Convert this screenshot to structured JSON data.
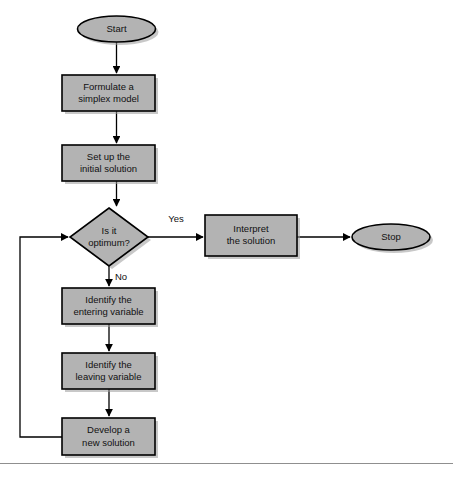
{
  "diagram": {
    "colors": {
      "shape_fill": "#b3b3b3",
      "shape_stroke": "#000000",
      "shadow": "#9a9a9a",
      "connector": "#000000",
      "background": "#ffffff",
      "footer_rule": "#8f8f8f"
    },
    "nodes": [
      {
        "id": "start",
        "shape": "terminator",
        "lines": [
          "Start"
        ],
        "cx": 116.5,
        "cy": 29,
        "rx": 39,
        "ry": 13
      },
      {
        "id": "formulate",
        "shape": "process",
        "lines": [
          "Formulate a",
          "simplex model"
        ],
        "x": 62,
        "y": 75,
        "w": 93,
        "h": 36
      },
      {
        "id": "setup",
        "shape": "process",
        "lines": [
          "Set up the",
          "initial solution"
        ],
        "x": 62,
        "y": 145,
        "w": 93,
        "h": 36
      },
      {
        "id": "decision",
        "shape": "decision",
        "lines": [
          "Is it",
          "optimum?"
        ],
        "cx": 109,
        "cy": 237,
        "hw": 39,
        "hh": 29
      },
      {
        "id": "interpret",
        "shape": "process",
        "lines": [
          "Interpret",
          "the solution"
        ],
        "x": 205,
        "y": 215,
        "w": 92,
        "h": 41
      },
      {
        "id": "stop",
        "shape": "terminator",
        "lines": [
          "Stop"
        ],
        "cx": 391,
        "cy": 237,
        "rx": 39,
        "ry": 13
      },
      {
        "id": "entering",
        "shape": "process",
        "lines": [
          "Identify the",
          "entering variable"
        ],
        "x": 62,
        "y": 288,
        "w": 93,
        "h": 36
      },
      {
        "id": "leaving",
        "shape": "process",
        "lines": [
          "Identify the",
          "leaving variable"
        ],
        "x": 62,
        "y": 353,
        "w": 93,
        "h": 36
      },
      {
        "id": "develop",
        "shape": "process",
        "lines": [
          "Develop a",
          "new solution"
        ],
        "x": 62,
        "y": 418,
        "w": 93,
        "h": 37
      }
    ],
    "edge_labels": [
      {
        "id": "yes-label",
        "text": "Yes",
        "x": 176,
        "y": 219
      },
      {
        "id": "no-label",
        "text": "No",
        "x": 121,
        "y": 277
      }
    ],
    "edges": [
      {
        "id": "start-to-formulate",
        "from": "start",
        "to": "formulate"
      },
      {
        "id": "formulate-to-setup",
        "from": "formulate",
        "to": "setup"
      },
      {
        "id": "setup-to-decision",
        "from": "setup",
        "to": "decision"
      },
      {
        "id": "decision-yes-to-interpret",
        "from": "decision",
        "to": "interpret",
        "label": "Yes"
      },
      {
        "id": "interpret-to-stop",
        "from": "interpret",
        "to": "stop"
      },
      {
        "id": "decision-no-to-entering",
        "from": "decision",
        "to": "entering",
        "label": "No"
      },
      {
        "id": "entering-to-leaving",
        "from": "entering",
        "to": "leaving"
      },
      {
        "id": "leaving-to-develop",
        "from": "leaving",
        "to": "develop"
      },
      {
        "id": "develop-feedback-to-decision",
        "from": "develop",
        "to": "decision"
      }
    ]
  }
}
